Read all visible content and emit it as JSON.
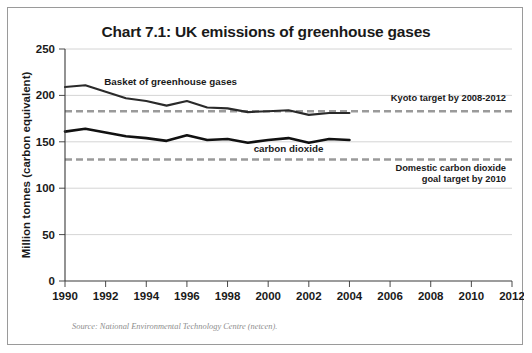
{
  "figure": {
    "title": "Chart 7.1: UK emissions of greenhouse gases",
    "source": "Source: National Environmental Technology Centre (netcen).",
    "border_color": "#9a9a9a",
    "background": "#ffffff"
  },
  "axes": {
    "y_axis_label": "Million tonnes (carbon equivalent)",
    "y_ticks": [
      "0",
      "50",
      "100",
      "150",
      "200",
      "250"
    ],
    "x_ticks": [
      "1990",
      "1992",
      "1994",
      "1996",
      "1998",
      "2000",
      "2002",
      "2004",
      "2006",
      "2008",
      "2010",
      "2012"
    ]
  },
  "annotations": {
    "basket_label": "Basket of greenhouse gases",
    "co2_label": "carbon dioxide",
    "kyoto_label": "Kyoto target by 2008-2012",
    "domestic_label_line1": "Domestic carbon dioxide",
    "domestic_label_line2": "goal target by 2010"
  },
  "chart_data": {
    "type": "line",
    "title": "Chart 7.1: UK emissions of greenhouse gases",
    "xlabel": "",
    "ylabel": "Million tonnes (carbon equivalent)",
    "xlim": [
      1990,
      2012
    ],
    "ylim": [
      0,
      250
    ],
    "ytick_interval": 50,
    "xtick_interval": 2,
    "grid": "horizontal-gridlines-at-yticks",
    "legend": "inline-annotations",
    "x": [
      1990,
      1991,
      1992,
      1993,
      1994,
      1995,
      1996,
      1997,
      1998,
      1999,
      2000,
      2001,
      2002,
      2003,
      2004
    ],
    "series": [
      {
        "name": "Basket of greenhouse gases",
        "color": "#2a2a2a",
        "width": 2.1,
        "values": [
          209,
          211,
          204,
          197,
          194,
          189,
          194,
          187,
          186,
          182,
          183,
          184,
          179,
          181,
          181
        ]
      },
      {
        "name": "carbon dioxide",
        "color": "#111111",
        "width": 2.6,
        "values": [
          161,
          164,
          160,
          156,
          154,
          151,
          157,
          152,
          153,
          149,
          152,
          154,
          149,
          153,
          152
        ]
      }
    ],
    "target_lines": [
      {
        "name": "Kyoto target by 2008-2012",
        "value": 183,
        "style": "dashed",
        "color": "#9a9a9a",
        "x_start": 1990,
        "x_end": 2012
      },
      {
        "name": "Domestic carbon dioxide goal target by 2010",
        "value": 131,
        "style": "dashed",
        "color": "#9a9a9a",
        "x_start": 1990,
        "x_end": 2012
      }
    ]
  }
}
